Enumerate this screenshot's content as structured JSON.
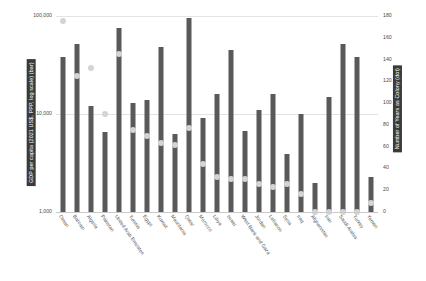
{
  "chart_data": {
    "type": "bar",
    "title": "",
    "subtitle": "",
    "xlabel": "",
    "ylabel": "GDP per capita (2021 US$, PPP, log scale) (bar)",
    "y2label": "Number of Years as Colony (dot)",
    "grid": true,
    "legend": "none",
    "yscale": "log",
    "ylim": [
      1000,
      100000
    ],
    "y2lim": [
      0,
      180
    ],
    "yticks": [
      "1,000",
      "10,000",
      "100,000"
    ],
    "ytick_values": [
      1000,
      10000,
      100000
    ],
    "y2ticks": [
      "0",
      "20",
      "40",
      "60",
      "80",
      "100",
      "120",
      "140",
      "160",
      "180"
    ],
    "y2tick_values": [
      0,
      20,
      40,
      60,
      80,
      100,
      120,
      140,
      160,
      180
    ],
    "categories": [
      "Oman",
      "Bahrain",
      "Algeria",
      "Pakistan",
      "United Arab Emirates",
      "Tunisia",
      "Egypt",
      "Kuwait",
      "Mauritania",
      "Qatar",
      "Morocco",
      "Libya",
      "Israel",
      "West Bank and Gaza",
      "Jordan",
      "Lebanon",
      "Syria",
      "Iraq",
      "Afghanistan",
      "Iran",
      "Saudi Arabia",
      "Turkey",
      "Yemen"
    ],
    "series": [
      {
        "name": "GDP per capita (2021 US$, PPP, log scale)",
        "type": "bar",
        "axis": "left",
        "color": "#595959",
        "values": [
          38000,
          52000,
          12000,
          6500,
          75000,
          13000,
          14000,
          48000,
          6300,
          95000,
          9000,
          16000,
          45000,
          6700,
          11000,
          16000,
          3900,
          10000,
          2000,
          15000,
          52000,
          38000,
          2300
        ]
      },
      {
        "name": "Number of Years as Colony",
        "type": "scatter",
        "axis": "right",
        "color": "#d4d4d4",
        "values": [
          175,
          125,
          132,
          90,
          145,
          75,
          70,
          63,
          62,
          77,
          44,
          32,
          30,
          30,
          26,
          23,
          26,
          17,
          0,
          0,
          0,
          0,
          8
        ]
      }
    ]
  }
}
